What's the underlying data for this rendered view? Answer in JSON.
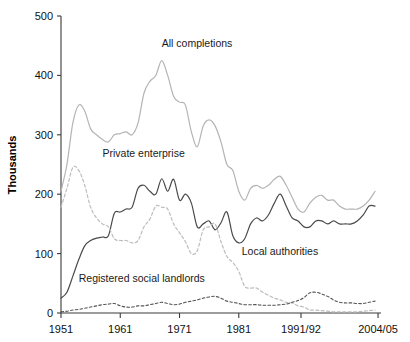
{
  "chart_data": {
    "type": "line",
    "title": "",
    "xlabel": "",
    "ylabel": "Thousands",
    "ylim": [
      0,
      500
    ],
    "yticks": [
      0,
      100,
      200,
      300,
      400,
      500
    ],
    "xlim": [
      1951,
      2005
    ],
    "xticks": [
      "1951",
      "1961",
      "1971",
      "1981",
      "1991/92",
      "2004/05"
    ],
    "xtick_values": [
      1951,
      1961,
      1971,
      1981,
      1991.5,
      2004.5
    ],
    "grid": false,
    "legend_position": "inline-annotations",
    "annotations": [
      {
        "name": "all-completions-label",
        "text": "All completions",
        "x": 1968,
        "y": 448
      },
      {
        "name": "private-enterprise-label",
        "text": "Private enterprise",
        "x": 1958,
        "y": 262
      },
      {
        "name": "local-authorities-label",
        "text": "Local authorities",
        "x": 1981.5,
        "y": 97
      },
      {
        "name": "registered-social-landlords-label",
        "text": "Registered social landlords",
        "x": 1954,
        "y": 52
      }
    ],
    "x": [
      1951,
      1952,
      1953,
      1954,
      1955,
      1956,
      1957,
      1958,
      1959,
      1960,
      1961,
      1962,
      1963,
      1964,
      1965,
      1966,
      1967,
      1968,
      1969,
      1970,
      1971,
      1972,
      1973,
      1974,
      1975,
      1976,
      1977,
      1978,
      1979,
      1980,
      1981,
      1982,
      1983,
      1984,
      1985,
      1986,
      1987,
      1988,
      1989,
      1990,
      1991,
      1992,
      1993,
      1994,
      1995,
      1996,
      1997,
      1998,
      1999,
      2000,
      2001,
      2002,
      2003,
      2004
    ],
    "series": [
      {
        "name": "All completions",
        "style": "solid",
        "color": "#b4b4b4",
        "values": [
          205,
          250,
          320,
          350,
          340,
          310,
          300,
          292,
          288,
          300,
          302,
          305,
          300,
          320,
          370,
          390,
          400,
          425,
          400,
          365,
          355,
          350,
          305,
          280,
          315,
          325,
          315,
          288,
          250,
          240,
          205,
          190,
          210,
          215,
          210,
          215,
          225,
          230,
          215,
          195,
          175,
          170,
          185,
          195,
          198,
          190,
          190,
          180,
          175,
          175,
          175,
          180,
          190,
          205
        ]
      },
      {
        "name": "Private enterprise",
        "style": "solid",
        "color": "#4a4a4a",
        "values": [
          25,
          35,
          62,
          90,
          113,
          122,
          126,
          128,
          130,
          168,
          170,
          175,
          178,
          210,
          215,
          205,
          200,
          226,
          205,
          225,
          190,
          200,
          185,
          145,
          150,
          155,
          140,
          152,
          170,
          130,
          118,
          125,
          150,
          160,
          155,
          165,
          185,
          200,
          180,
          160,
          155,
          145,
          145,
          155,
          155,
          150,
          155,
          150,
          150,
          150,
          155,
          165,
          180,
          180
        ]
      },
      {
        "name": "Local authorities",
        "style": "dotted",
        "color": "#bdbdbd",
        "values": [
          178,
          210,
          245,
          240,
          215,
          178,
          160,
          150,
          145,
          125,
          122,
          122,
          118,
          122,
          145,
          158,
          180,
          178,
          175,
          150,
          135,
          120,
          100,
          105,
          140,
          145,
          150,
          120,
          95,
          85,
          70,
          45,
          42,
          42,
          35,
          30,
          25,
          22,
          18,
          17,
          12,
          10,
          5,
          5,
          4,
          3,
          2,
          2,
          2,
          2,
          2,
          3,
          4,
          5
        ]
      },
      {
        "name": "Registered social landlords",
        "style": "dashed",
        "color": "#555555",
        "values": [
          2,
          3,
          5,
          6,
          8,
          10,
          12,
          14,
          15,
          16,
          12,
          10,
          10,
          12,
          12,
          14,
          16,
          18,
          16,
          14,
          15,
          18,
          20,
          22,
          25,
          27,
          28,
          25,
          20,
          18,
          16,
          14,
          14,
          14,
          13,
          13,
          13,
          14,
          15,
          18,
          21,
          26,
          34,
          35,
          32,
          28,
          22,
          18,
          17,
          17,
          16,
          16,
          18,
          20
        ]
      }
    ]
  },
  "axis": {
    "y_title": "Thousands"
  }
}
